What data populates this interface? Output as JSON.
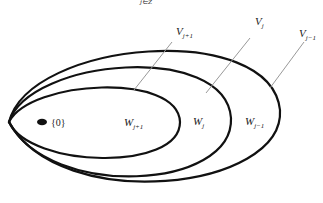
{
  "diagram": {
    "title_fragment": "j∈Z",
    "subspaces": [
      {
        "name": "V",
        "sub": "j+1",
        "annotation": "V_{j+1}"
      },
      {
        "name": "V",
        "sub": "j",
        "annotation": "V_j"
      },
      {
        "name": "V",
        "sub": "j−1",
        "annotation": "V_{j-1}"
      }
    ],
    "regions": [
      {
        "name": "W",
        "sub": "j+1"
      },
      {
        "name": "W",
        "sub": "j"
      },
      {
        "name": "W",
        "sub": "j−1"
      }
    ],
    "origin_label": "{0}",
    "colors": {
      "stroke": "#111111",
      "leader": "#999999",
      "background": "#ffffff"
    }
  }
}
